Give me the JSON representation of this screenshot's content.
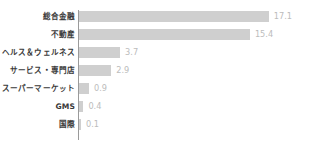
{
  "chart_data": {
    "type": "bar",
    "orientation": "horizontal",
    "title": "",
    "subtitle": "",
    "xlabel": "",
    "ylabel": "",
    "categories": [
      "総合金融",
      "不動産",
      "ヘルス＆ウェルネス",
      "サービス・専門店",
      "スーパーマーケット",
      "GMS",
      "国際"
    ],
    "values": [
      17.1,
      15.4,
      3.7,
      2.9,
      0.9,
      0.4,
      0.1
    ],
    "value_labels": [
      "17.1",
      "15.4",
      "3.7",
      "2.9",
      "0.9",
      "0.4",
      "0.1"
    ],
    "xlim": [
      0,
      17.1
    ],
    "grid": false,
    "legend": false,
    "legend_position": "none",
    "bar_color": "#cfcfcf",
    "value_label_color": "#bcbcbc",
    "category_label_color": "#3a3a3a",
    "axis_line_color": "#9a9a9a",
    "background_color": "#ffffff"
  },
  "layout": {
    "bar_origin_x_px": 79,
    "pixels_per_unit": 11.1,
    "row_pitch_px": 18,
    "first_row_top_px": 7,
    "bar_height_px": 11
  }
}
